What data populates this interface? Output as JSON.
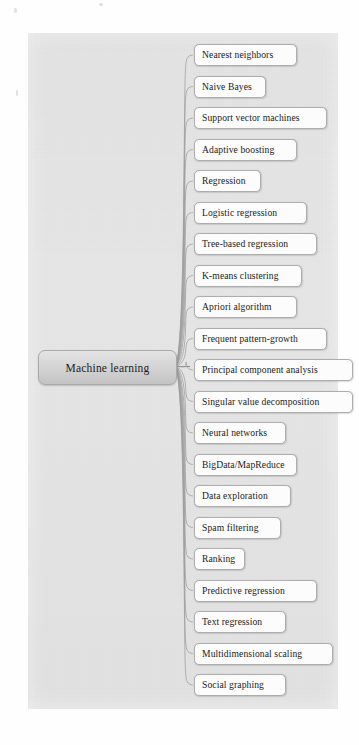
{
  "diagram": {
    "type": "mind-map",
    "title": "Machine learning",
    "root": {
      "label": "Machine learning"
    },
    "branches": [
      {
        "label": "Nearest neighbors"
      },
      {
        "label": "Naive Bayes"
      },
      {
        "label": "Support vector machines"
      },
      {
        "label": "Adaptive boosting"
      },
      {
        "label": "Regression"
      },
      {
        "label": "Logistic regression"
      },
      {
        "label": "Tree-based regression"
      },
      {
        "label": "K-means clustering"
      },
      {
        "label": "Apriori algorithm"
      },
      {
        "label": "Frequent pattern-growth"
      },
      {
        "label": "Principal component analysis"
      },
      {
        "label": "Singular value decomposition"
      },
      {
        "label": "Neural networks"
      },
      {
        "label": "BigData/MapReduce"
      },
      {
        "label": "Data exploration"
      },
      {
        "label": "Spam filtering"
      },
      {
        "label": "Ranking"
      },
      {
        "label": "Predictive regression"
      },
      {
        "label": "Text regression"
      },
      {
        "label": "Multidimensional scaling"
      },
      {
        "label": "Social graphing"
      }
    ],
    "colors": {
      "canvas_background": "#e6e6e6",
      "page_background": "#fefefe",
      "root_fill_top": "#e4e4e4",
      "root_fill_bottom": "#c3c3c3",
      "node_fill": "#fcfcfc",
      "node_border": "#adadad",
      "connector_stroke": "#9b9b9b",
      "text_color": "#1b1b1b"
    }
  }
}
